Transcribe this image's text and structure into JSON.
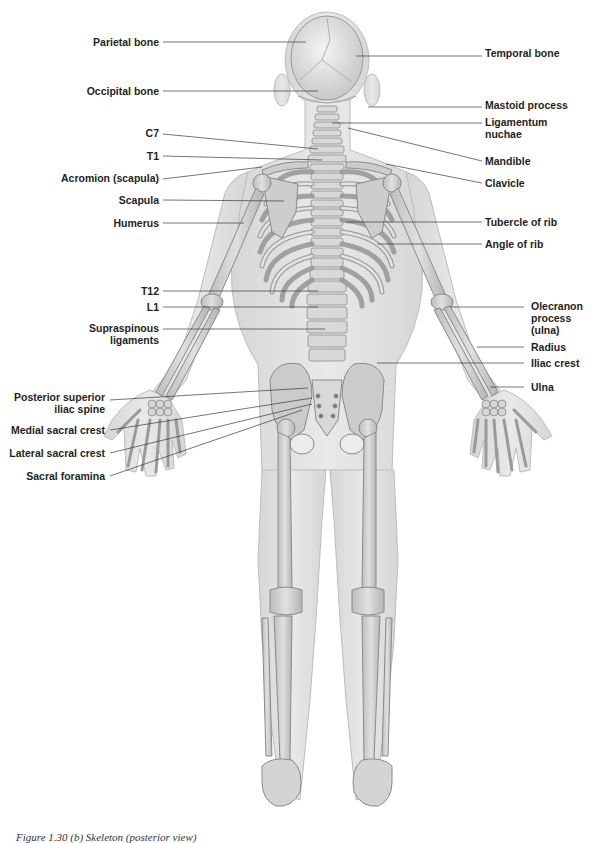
{
  "figure": {
    "title": "Skeleton (posterior view)",
    "caption": "Figure 1.30 (b) Skeleton (posterior view)",
    "colors": {
      "background": "#ffffff",
      "skin": "#e2e2e2",
      "skin_outline": "#b9b9b9",
      "bone": "#cfcfcf",
      "bone_outline": "#8a8a8a",
      "leader_line": "#3a3a3a",
      "label_text": "#231f20"
    }
  },
  "labels_left": [
    {
      "id": "parietal-bone",
      "text": "Parietal bone"
    },
    {
      "id": "occipital-bone",
      "text": "Occipital bone"
    },
    {
      "id": "c7",
      "text": "C7"
    },
    {
      "id": "t1",
      "text": "T1"
    },
    {
      "id": "acromion",
      "text": "Acromion (scapula)"
    },
    {
      "id": "scapula",
      "text": "Scapula"
    },
    {
      "id": "humerus",
      "text": "Humerus"
    },
    {
      "id": "t12",
      "text": "T12"
    },
    {
      "id": "l1",
      "text": "L1"
    },
    {
      "id": "supraspinous",
      "text": "Supraspinous",
      "text2": "ligaments"
    },
    {
      "id": "psis",
      "text": "Posterior superior",
      "text2": "iliac spine"
    },
    {
      "id": "medial-sacral-crest",
      "text": "Medial sacral crest"
    },
    {
      "id": "lateral-sacral-crest",
      "text": "Lateral sacral crest"
    },
    {
      "id": "sacral-foramina",
      "text": "Sacral foramina"
    }
  ],
  "labels_right": [
    {
      "id": "temporal-bone",
      "text": "Temporal bone"
    },
    {
      "id": "mastoid-process",
      "text": "Mastoid process"
    },
    {
      "id": "ligamentum-nuchae",
      "text": "Ligamentum",
      "text2": "nuchae"
    },
    {
      "id": "mandible",
      "text": "Mandible"
    },
    {
      "id": "clavicle",
      "text": "Clavicle"
    },
    {
      "id": "tubercle-of-rib",
      "text": "Tubercle of rib"
    },
    {
      "id": "angle-of-rib",
      "text": "Angle of rib"
    },
    {
      "id": "olecranon",
      "text": "Olecranon",
      "text2": "process",
      "text3": "(ulna)"
    },
    {
      "id": "radius",
      "text": "Radius"
    },
    {
      "id": "iliac-crest",
      "text": "Iliac crest"
    },
    {
      "id": "ulna",
      "text": "Ulna"
    }
  ]
}
